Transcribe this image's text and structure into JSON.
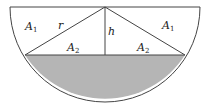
{
  "diagram": {
    "colors": {
      "stroke": "#444444",
      "shade": "#b5b5b5",
      "background": "#ffffff"
    },
    "labels": {
      "a1_left": {
        "main": "A",
        "sub": "1"
      },
      "a1_right": {
        "main": "A",
        "sub": "1"
      },
      "a2_left": {
        "main": "A",
        "sub": "2"
      },
      "a2_right": {
        "main": "A",
        "sub": "2"
      },
      "radius": "r",
      "height": "h"
    }
  }
}
